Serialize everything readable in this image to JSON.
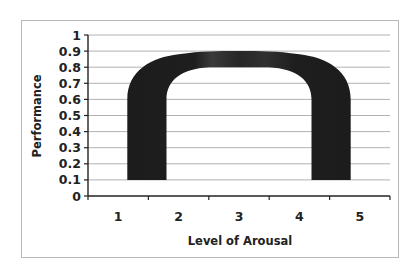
{
  "chart_data": {
    "type": "area",
    "title": "",
    "xlabel": "Level of Arousal",
    "ylabel": "Performance",
    "categories": [
      "1",
      "2",
      "3",
      "4",
      "5"
    ],
    "ylim": [
      0,
      1
    ],
    "yticks": [
      "0",
      "0.1",
      "0.2",
      "0.3",
      "0.4",
      "0.5",
      "0.6",
      "0.7",
      "0.8",
      "0.9",
      "1"
    ],
    "grid": true,
    "legend": null,
    "series": [
      {
        "name": "Performance band (inverted-U)",
        "shape": "thick inverted-U band",
        "color": "#1f1f1f",
        "outer_edge": {
          "x": [
            1.15,
            1.15,
            1.4,
            2.0,
            3.0,
            4.0,
            4.6,
            4.85,
            4.85
          ],
          "y": [
            0.1,
            0.6,
            0.8,
            0.88,
            0.9,
            0.88,
            0.8,
            0.6,
            0.1
          ]
        },
        "inner_edge": {
          "x": [
            1.8,
            1.8,
            2.1,
            3.0,
            3.9,
            4.2,
            4.2
          ],
          "y": [
            0.1,
            0.6,
            0.75,
            0.8,
            0.75,
            0.6,
            0.1
          ]
        }
      }
    ]
  }
}
